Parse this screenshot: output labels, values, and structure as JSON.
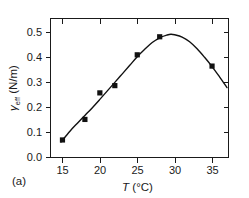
{
  "panel": {
    "label": "(a)"
  },
  "chart_data": {
    "type": "scatter",
    "title": "",
    "subtitle": "",
    "xlabel": "T (°C)",
    "xlabel_symbol": "T",
    "xlabel_units": "(°C)",
    "ylabel": "γeff (N/m)",
    "ylabel_symbol": "γ",
    "ylabel_subscript": "eff",
    "ylabel_units": "(N/m)",
    "xlim": [
      13.4,
      37.2
    ],
    "ylim": [
      0.0,
      0.555
    ],
    "xticks": [
      15,
      20,
      25,
      30,
      35
    ],
    "xtick_labels": [
      "15",
      "20",
      "25",
      "30",
      "35"
    ],
    "yticks": [
      0.0,
      0.1,
      0.2,
      0.3,
      0.4,
      0.5
    ],
    "ytick_labels": [
      "0.0",
      "0.1",
      "0.2",
      "0.3",
      "0.4",
      "0.5"
    ],
    "grid": false,
    "legend": null,
    "frame": "box",
    "tick_direction_bottom_left": "out",
    "tick_direction_top_right": "in",
    "marker_style": "filled-square",
    "marker_color": "#111111",
    "line_color": "#111111",
    "x": [
      15,
      18,
      20,
      22,
      25,
      28,
      35
    ],
    "y": [
      0.07,
      0.152,
      0.258,
      0.287,
      0.41,
      0.482,
      0.365
    ],
    "points": [
      {
        "T": 15,
        "gamma_eff": 0.07
      },
      {
        "T": 18,
        "gamma_eff": 0.152
      },
      {
        "T": 20,
        "gamma_eff": 0.258
      },
      {
        "T": 22,
        "gamma_eff": 0.287
      },
      {
        "T": 25,
        "gamma_eff": 0.41
      },
      {
        "T": 28,
        "gamma_eff": 0.482
      },
      {
        "T": 35,
        "gamma_eff": 0.365
      }
    ],
    "fit_curve": {
      "description": "smooth fitted curve through points, peaking near T = 29.5",
      "peak_T": 29.5,
      "peak_gamma_eff": 0.492,
      "x": [
        14.8,
        16,
        17,
        18,
        19,
        20,
        21,
        22,
        23,
        24,
        25,
        26,
        27,
        28,
        29,
        29.5,
        30,
        31,
        32,
        33,
        34,
        35,
        36,
        37
      ],
      "y": [
        0.062,
        0.105,
        0.137,
        0.168,
        0.199,
        0.232,
        0.266,
        0.3,
        0.334,
        0.368,
        0.402,
        0.432,
        0.459,
        0.478,
        0.489,
        0.492,
        0.49,
        0.481,
        0.462,
        0.434,
        0.4,
        0.363,
        0.322,
        0.279
      ]
    }
  }
}
